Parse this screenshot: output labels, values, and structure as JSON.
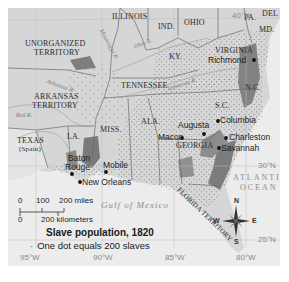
{
  "map": {
    "title": "Slave population, 1820",
    "legend_note": "One dot equals 200 slaves",
    "legend_bullet": "·",
    "colors": {
      "land": "#d6d6d6",
      "water": "#ececec",
      "dense": "#7f7f7f",
      "border": "#6a6a6a",
      "city": "#111111"
    },
    "regions": {
      "illinois": "ILLINOIS",
      "indiana": "IND.",
      "ohio": "OHIO",
      "pennsylvania": "PA.",
      "delaware": "DEL",
      "maryland": "MD.",
      "virginia": "VIRGINIA",
      "kentucky": "KY.",
      "tennessee": "TENNESSEE",
      "north_carolina": "N.C.",
      "south_carolina": "S.C.",
      "georgia": "GEORGIA",
      "alabama": "ALA.",
      "mississippi": "MISS.",
      "louisiana": "LA.",
      "unorganized_territory_1": "UNORGANIZED",
      "unorganized_territory_2": "TERRITORY",
      "arkansas_territory_1": "ARKANSAS",
      "arkansas_territory_2": "TERRITORY",
      "texas_1": "TEXAS",
      "texas_2": "(Spain)",
      "florida_territory": "FLORIDA TERRITORY"
    },
    "cities": {
      "richmond": "Richmond",
      "columbia": "Columbia",
      "augusta": "Augusta",
      "charleston": "Charleston",
      "macon": "Macon",
      "savannah": "Savannah",
      "baton_rouge_1": "Baton",
      "baton_rouge_2": "Rouge",
      "mobile": "Mobile",
      "new_orleans": "New Orleans"
    },
    "rivers": {
      "mississippi": "Mississippi R.",
      "ohio": "Ohio R.",
      "arkansas": "Arkansas R.",
      "red": "Red R.",
      "tennessee": "Tennessee R."
    },
    "water_bodies": {
      "gulf": "Gulf of Mexico",
      "atlantic_1": "ATLANTIC",
      "atlantic_2": "OCEAN"
    },
    "coordinates": {
      "lat_40": "40°N",
      "lat_30": "30°N",
      "lat_25": "25°N",
      "lon_95": "95°W",
      "lon_90": "90°W",
      "lon_85": "85°W",
      "lon_80": "80°W"
    },
    "scale": {
      "miles_0": "0",
      "miles_100": "100",
      "miles_200": "200 miles",
      "km_0": "0",
      "km_200": "200 kilometers"
    },
    "compass": {
      "n": "N",
      "s": "S",
      "e": "E",
      "w": "W"
    }
  }
}
